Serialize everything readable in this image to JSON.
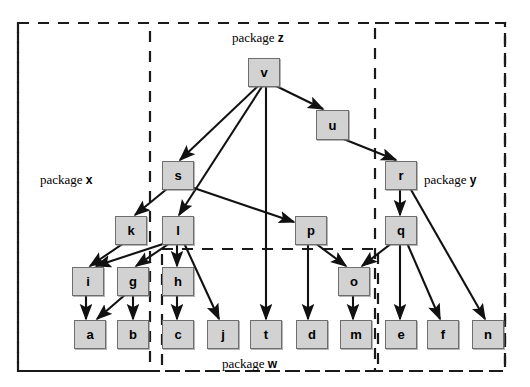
{
  "diagram": {
    "canvas": {
      "width": 530,
      "height": 387
    },
    "style": {
      "node_fill": "#d2d2d2",
      "node_stroke": "#6e6e6e",
      "edge_color": "#111111",
      "boundary_color": "#1a1a1a",
      "background": "#ffffff"
    },
    "packages": [
      {
        "id": "z",
        "label_prefix": "package",
        "label_name": "z",
        "label_x": 232,
        "label_y": 30,
        "box": {
          "x": 18,
          "y": 23,
          "w": 487,
          "h": 348
        }
      },
      {
        "id": "x",
        "label_prefix": "package",
        "label_name": "x",
        "label_x": 40,
        "label_y": 172,
        "box": {
          "x": 18,
          "y": 23,
          "w": 132,
          "h": 348
        }
      },
      {
        "id": "y",
        "label_prefix": "package",
        "label_name": "y",
        "label_x": 424,
        "label_y": 172,
        "box": {
          "x": 375,
          "y": 23,
          "w": 130,
          "h": 348
        }
      },
      {
        "id": "w",
        "label_prefix": "package",
        "label_name": "w",
        "label_x": 222,
        "label_y": 356,
        "box": {
          "x": 162,
          "y": 249,
          "w": 216,
          "h": 122
        }
      }
    ],
    "nodes": [
      {
        "id": "v",
        "label": "v",
        "x": 248,
        "y": 58,
        "w": 30,
        "h": 27
      },
      {
        "id": "u",
        "label": "u",
        "x": 316,
        "y": 110,
        "w": 31,
        "h": 28
      },
      {
        "id": "s",
        "label": "s",
        "x": 162,
        "y": 161,
        "w": 30,
        "h": 27
      },
      {
        "id": "r",
        "label": "r",
        "x": 385,
        "y": 161,
        "w": 30,
        "h": 27
      },
      {
        "id": "k",
        "label": "k",
        "x": 115,
        "y": 216,
        "w": 30,
        "h": 27
      },
      {
        "id": "l",
        "label": "l",
        "x": 162,
        "y": 216,
        "w": 30,
        "h": 27
      },
      {
        "id": "p",
        "label": "p",
        "x": 295,
        "y": 216,
        "w": 30,
        "h": 27
      },
      {
        "id": "q",
        "label": "q",
        "x": 385,
        "y": 216,
        "w": 30,
        "h": 27
      },
      {
        "id": "i",
        "label": "i",
        "x": 72,
        "y": 267,
        "w": 30,
        "h": 27
      },
      {
        "id": "g",
        "label": "g",
        "x": 117,
        "y": 267,
        "w": 30,
        "h": 27
      },
      {
        "id": "h",
        "label": "h",
        "x": 162,
        "y": 267,
        "w": 30,
        "h": 27
      },
      {
        "id": "o",
        "label": "o",
        "x": 338,
        "y": 267,
        "w": 30,
        "h": 27
      },
      {
        "id": "a",
        "label": "a",
        "x": 74,
        "y": 320,
        "w": 30,
        "h": 27
      },
      {
        "id": "b",
        "label": "b",
        "x": 117,
        "y": 320,
        "w": 30,
        "h": 27
      },
      {
        "id": "c",
        "label": "c",
        "x": 162,
        "y": 320,
        "w": 30,
        "h": 27
      },
      {
        "id": "j",
        "label": "j",
        "x": 207,
        "y": 320,
        "w": 30,
        "h": 27
      },
      {
        "id": "t",
        "label": "t",
        "x": 250,
        "y": 320,
        "w": 30,
        "h": 27
      },
      {
        "id": "d",
        "label": "d",
        "x": 296,
        "y": 320,
        "w": 30,
        "h": 27
      },
      {
        "id": "m",
        "label": "m",
        "x": 340,
        "y": 320,
        "w": 30,
        "h": 27
      },
      {
        "id": "e",
        "label": "e",
        "x": 385,
        "y": 320,
        "w": 30,
        "h": 27
      },
      {
        "id": "f",
        "label": "f",
        "x": 427,
        "y": 320,
        "w": 30,
        "h": 27
      },
      {
        "id": "n",
        "label": "n",
        "x": 472,
        "y": 320,
        "w": 30,
        "h": 27
      }
    ],
    "edges": [
      {
        "from": "v",
        "to": "s",
        "x1": 259,
        "y1": 85,
        "x2": 180,
        "y2": 160
      },
      {
        "from": "v",
        "to": "l",
        "x1": 263,
        "y1": 85,
        "x2": 179,
        "y2": 215
      },
      {
        "from": "v",
        "to": "t",
        "x1": 266,
        "y1": 85,
        "x2": 266,
        "y2": 319
      },
      {
        "from": "v",
        "to": "u",
        "x1": 274,
        "y1": 85,
        "x2": 323,
        "y2": 109
      },
      {
        "from": "u",
        "to": "r",
        "x1": 341,
        "y1": 138,
        "x2": 396,
        "y2": 160
      },
      {
        "from": "s",
        "to": "k",
        "x1": 168,
        "y1": 188,
        "x2": 135,
        "y2": 215
      },
      {
        "from": "s",
        "to": "p",
        "x1": 188,
        "y1": 186,
        "x2": 294,
        "y2": 222
      },
      {
        "from": "r",
        "to": "q",
        "x1": 400,
        "y1": 188,
        "x2": 400,
        "y2": 215
      },
      {
        "from": "r",
        "to": "n",
        "x1": 410,
        "y1": 188,
        "x2": 485,
        "y2": 319
      },
      {
        "from": "k",
        "to": "i",
        "x1": 124,
        "y1": 243,
        "x2": 90,
        "y2": 266
      },
      {
        "from": "l",
        "to": "i",
        "x1": 166,
        "y1": 243,
        "x2": 96,
        "y2": 266
      },
      {
        "from": "l",
        "to": "g",
        "x1": 170,
        "y1": 243,
        "x2": 136,
        "y2": 266
      },
      {
        "from": "l",
        "to": "h",
        "x1": 177,
        "y1": 243,
        "x2": 177,
        "y2": 266
      },
      {
        "from": "l",
        "to": "j",
        "x1": 184,
        "y1": 243,
        "x2": 219,
        "y2": 319
      },
      {
        "from": "p",
        "to": "d",
        "x1": 308,
        "y1": 243,
        "x2": 308,
        "y2": 319
      },
      {
        "from": "p",
        "to": "o",
        "x1": 315,
        "y1": 243,
        "x2": 346,
        "y2": 266
      },
      {
        "from": "q",
        "to": "o",
        "x1": 392,
        "y1": 243,
        "x2": 362,
        "y2": 266
      },
      {
        "from": "q",
        "to": "e",
        "x1": 400,
        "y1": 243,
        "x2": 400,
        "y2": 319
      },
      {
        "from": "q",
        "to": "f",
        "x1": 407,
        "y1": 243,
        "x2": 440,
        "y2": 319
      },
      {
        "from": "i",
        "to": "a",
        "x1": 86,
        "y1": 294,
        "x2": 86,
        "y2": 319
      },
      {
        "from": "g",
        "to": "a",
        "x1": 126,
        "y1": 294,
        "x2": 97,
        "y2": 319
      },
      {
        "from": "g",
        "to": "b",
        "x1": 133,
        "y1": 294,
        "x2": 133,
        "y2": 319
      },
      {
        "from": "h",
        "to": "c",
        "x1": 177,
        "y1": 294,
        "x2": 177,
        "y2": 319
      },
      {
        "from": "o",
        "to": "m",
        "x1": 353,
        "y1": 294,
        "x2": 353,
        "y2": 319
      }
    ]
  }
}
